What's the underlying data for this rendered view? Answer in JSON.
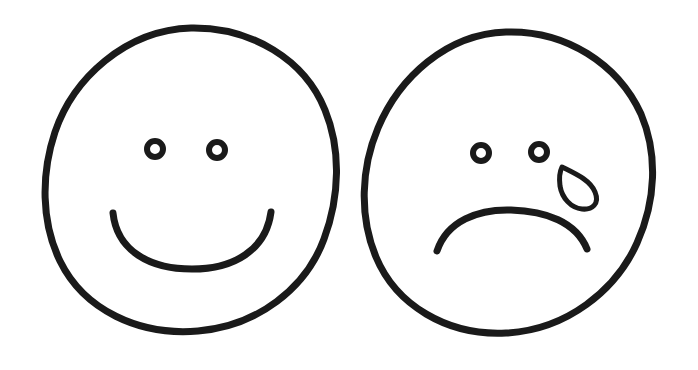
{
  "document": {
    "title": "Smiley and Sad Face Line Drawing",
    "background_color": "#ffffff",
    "ink_color": "#1a1a1a",
    "width": 698,
    "height": 370,
    "medium": "hand-drawn marker line art",
    "figure_count": 2
  },
  "figures": [
    {
      "id": "happy-face",
      "label": "Happy Face",
      "emotion": "happy",
      "head": {
        "shape": "circle",
        "center_x": 191,
        "center_y": 180,
        "radius_x": 146,
        "radius_y": 152,
        "stroke_width": 7,
        "color": "#1a1a1a"
      },
      "eyes": [
        {
          "id": "left-eye",
          "center_x": 155,
          "center_y": 149,
          "outer_radius": 11,
          "inner_radius": 5,
          "shape": "ring"
        },
        {
          "id": "right-eye",
          "center_x": 217,
          "center_y": 150,
          "outer_radius": 11,
          "inner_radius": 5,
          "shape": "ring"
        }
      ],
      "mouth": {
        "id": "smile",
        "shape": "arc-upturned",
        "start_x": 113,
        "start_y": 213,
        "end_x": 271,
        "end_y": 212,
        "apex_y": 268,
        "stroke_width": 7
      },
      "tear": null
    },
    {
      "id": "sad-face",
      "label": "Sad Face",
      "emotion": "sad",
      "head": {
        "shape": "circle",
        "center_x": 510,
        "center_y": 183,
        "radius_x": 145,
        "radius_y": 151,
        "stroke_width": 7,
        "color": "#1a1a1a"
      },
      "eyes": [
        {
          "id": "left-eye",
          "center_x": 481,
          "center_y": 153,
          "outer_radius": 11,
          "inner_radius": 5,
          "shape": "ring"
        },
        {
          "id": "right-eye",
          "center_x": 539,
          "center_y": 152,
          "outer_radius": 11,
          "inner_radius": 5,
          "shape": "ring"
        }
      ],
      "mouth": {
        "id": "frown",
        "shape": "arc-downturned",
        "start_x": 437,
        "start_y": 251,
        "end_x": 587,
        "end_y": 249,
        "apex_y": 209,
        "stroke_width": 7
      },
      "tear": {
        "id": "teardrop",
        "shape": "teardrop",
        "tip_x": 562,
        "tip_y": 167,
        "bulb_center_x": 584,
        "bulb_center_y": 192,
        "bulb_radius": 15,
        "stroke_width": 5
      }
    }
  ]
}
